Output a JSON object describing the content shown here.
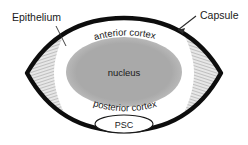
{
  "figure": {
    "background_color": "#ffffff"
  },
  "labels": {
    "epithelium": "Epithelium",
    "capsule": "Capsule",
    "anterior_cortex": "anterior cortex",
    "posterior_cortex": "posterior cortex",
    "nucleus": "nucleus",
    "psc": "PSC"
  },
  "colors": {
    "capsule": "#0d0d0d",
    "cortex": "#ffffff",
    "nucleus": "#a9a9a9",
    "fibers": "#9b9b9b",
    "text": "#1a1a1a",
    "leader": "#2b2b2b"
  },
  "structure": {
    "outline_shape": "biconvex-lentoid",
    "equator_left_x": 27,
    "equator_right_x": 221,
    "equator_y": 73,
    "nucleus_center_x": 124,
    "nucleus_center_y": 72,
    "nucleus_radius_x": 58,
    "nucleus_radius_y": 35
  },
  "annotations": [
    {
      "name": "epithelium",
      "text": "Epithelium",
      "x": 12,
      "y": 21,
      "target_x": 63,
      "target_y": 44
    },
    {
      "name": "capsule",
      "text": "Capsule",
      "x": 200,
      "y": 17,
      "target_x": 176,
      "target_y": 33
    }
  ]
}
